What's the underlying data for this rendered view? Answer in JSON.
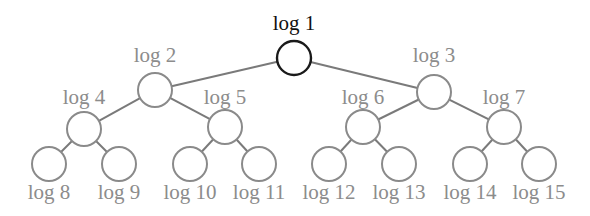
{
  "diagram": {
    "colors": {
      "root_stroke": "#1a1a1a",
      "node_stroke": "#8a8a8a",
      "edge": "#7a7a7a",
      "root_label": "#111111",
      "label": "#8c8c8c"
    },
    "nodes": [
      {
        "id": 1,
        "label": "log 1",
        "cx": 294,
        "cy": 58,
        "r": 17,
        "label_x": 294,
        "label_y": 30,
        "root": true
      },
      {
        "id": 2,
        "label": "log 2",
        "cx": 155,
        "cy": 90,
        "r": 17,
        "label_x": 155,
        "label_y": 62
      },
      {
        "id": 3,
        "label": "log 3",
        "cx": 434,
        "cy": 92,
        "r": 17,
        "label_x": 434,
        "label_y": 62
      },
      {
        "id": 4,
        "label": "log 4",
        "cx": 84,
        "cy": 129,
        "r": 17,
        "label_x": 84,
        "label_y": 104
      },
      {
        "id": 5,
        "label": "log 5",
        "cx": 225,
        "cy": 127,
        "r": 17,
        "label_x": 225,
        "label_y": 104
      },
      {
        "id": 6,
        "label": "log 6",
        "cx": 363,
        "cy": 127,
        "r": 17,
        "label_x": 363,
        "label_y": 104
      },
      {
        "id": 7,
        "label": "log 7",
        "cx": 504,
        "cy": 127,
        "r": 17,
        "label_x": 504,
        "label_y": 104
      },
      {
        "id": 8,
        "label": "log 8",
        "cx": 49,
        "cy": 164,
        "r": 17,
        "label_x": 49,
        "label_y": 199
      },
      {
        "id": 9,
        "label": "log 9",
        "cx": 119,
        "cy": 164,
        "r": 17,
        "label_x": 119,
        "label_y": 199
      },
      {
        "id": 10,
        "label": "log 10",
        "cx": 190,
        "cy": 164,
        "r": 17,
        "label_x": 190,
        "label_y": 199
      },
      {
        "id": 11,
        "label": "log 11",
        "cx": 259,
        "cy": 164,
        "r": 17,
        "label_x": 259,
        "label_y": 199
      },
      {
        "id": 12,
        "label": "log 12",
        "cx": 329,
        "cy": 164,
        "r": 17,
        "label_x": 329,
        "label_y": 199
      },
      {
        "id": 13,
        "label": "log 13",
        "cx": 399,
        "cy": 164,
        "r": 17,
        "label_x": 399,
        "label_y": 199
      },
      {
        "id": 14,
        "label": "log 14",
        "cx": 470,
        "cy": 164,
        "r": 17,
        "label_x": 470,
        "label_y": 199
      },
      {
        "id": 15,
        "label": "log 15",
        "cx": 539,
        "cy": 164,
        "r": 17,
        "label_x": 539,
        "label_y": 199
      }
    ],
    "edges": [
      [
        1,
        2
      ],
      [
        1,
        3
      ],
      [
        2,
        4
      ],
      [
        2,
        5
      ],
      [
        3,
        6
      ],
      [
        3,
        7
      ],
      [
        4,
        8
      ],
      [
        4,
        9
      ],
      [
        5,
        10
      ],
      [
        5,
        11
      ],
      [
        6,
        12
      ],
      [
        6,
        13
      ],
      [
        7,
        14
      ],
      [
        7,
        15
      ]
    ]
  }
}
